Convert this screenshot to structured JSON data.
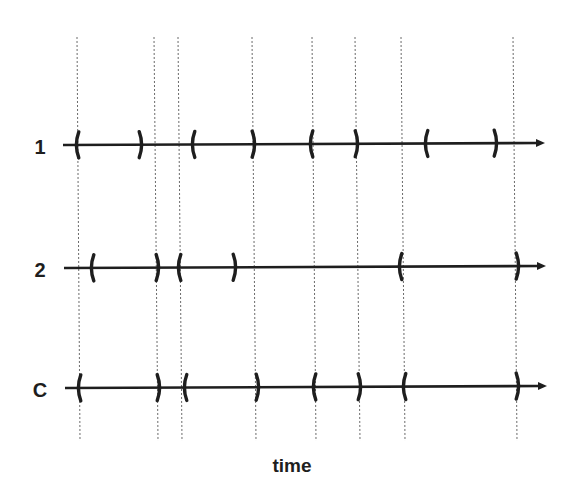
{
  "diagram": {
    "type": "interval-timeline",
    "colors": {
      "ink": "#1e1e1e",
      "guide": "#6a6a6a",
      "background": "#ffffff"
    },
    "x_axis_label": "time",
    "guides": {
      "y_top": 37,
      "y_bottom": 441,
      "x_top": [
        77,
        154,
        178,
        252,
        312,
        355,
        401,
        513
      ],
      "x_bottom": [
        80,
        158,
        182,
        256,
        316,
        360,
        405,
        517
      ]
    },
    "rows": [
      {
        "label": "1",
        "y": 145,
        "x_start": 63,
        "x_end": 545,
        "intervals": [
          {
            "open": 78,
            "close": 140
          },
          {
            "open": 194,
            "close": 253
          },
          {
            "open": 312,
            "close": 356
          },
          {
            "open": 427,
            "close": 495
          }
        ]
      },
      {
        "label": "2",
        "y": 268,
        "x_start": 64,
        "x_end": 546,
        "intervals": [
          {
            "open": 93,
            "close": 157
          },
          {
            "open": 180,
            "close": 234
          },
          {
            "open": 401,
            "close": 517
          }
        ]
      },
      {
        "label": "C",
        "y": 388,
        "x_start": 65,
        "x_end": 547,
        "intervals": [
          {
            "open": 80,
            "close": 158
          },
          {
            "open": 186,
            "close": 257
          },
          {
            "open": 315,
            "close": 359
          },
          {
            "open": 405,
            "close": 517
          }
        ]
      }
    ]
  }
}
